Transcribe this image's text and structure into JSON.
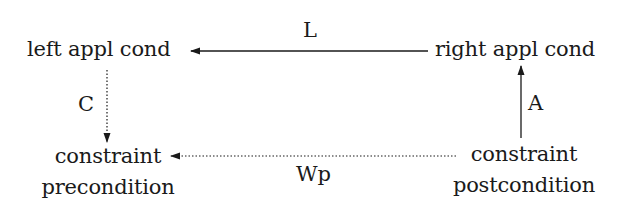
{
  "diagram": {
    "nodes": {
      "left_appl_cond": {
        "label": "left appl cond"
      },
      "right_appl_cond": {
        "label": "right appl cond"
      },
      "constraint_precondition": {
        "line1": "constraint",
        "line2": "precondition"
      },
      "constraint_postcondition": {
        "line1": "constraint",
        "line2": "postcondition"
      }
    },
    "edges": {
      "L": {
        "label": "L",
        "from": "right appl cond",
        "to": "left appl cond",
        "style": "solid"
      },
      "C": {
        "label": "C",
        "from": "left appl cond",
        "to": "constraint precondition",
        "style": "dotted"
      },
      "A": {
        "label": "A",
        "from": "constraint postcondition",
        "to": "right appl cond",
        "style": "solid"
      },
      "Wp": {
        "label": "Wp",
        "from": "constraint postcondition",
        "to": "constraint precondition",
        "style": "dotted"
      }
    },
    "colors": {
      "stroke": "#1a1a1a",
      "background": "#ffffff"
    }
  }
}
